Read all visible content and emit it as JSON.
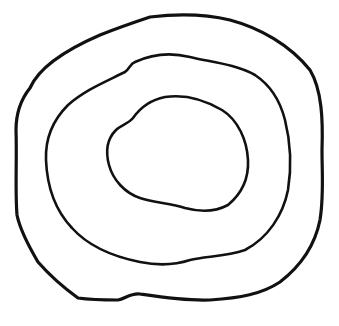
{
  "image": {
    "description": "Hand-drawn sketch of three concentric irregular closed rings",
    "background": "#ffffff",
    "stroke_color": "#111111"
  },
  "rings": [
    {
      "name": "outer-ring",
      "stroke_width": 3.2,
      "path": "M 30 88 C 40 65, 70 48, 100 35 C 120 27, 135 22, 150 17 C 175 14, 205 14, 230 20 C 260 28, 290 45, 310 70 C 322 90, 323 120, 322 150 C 322 175, 324 195, 320 220 C 315 245, 302 265, 280 282 C 262 294, 240 298, 210 300 C 185 301, 160 297, 140 294 C 130 293, 125 299, 118 300 C 100 300, 85 299, 78 298 C 60 285, 45 270, 38 262 C 28 245, 20 230, 17 215 C 15 190, 17 160, 16 130 C 16 110, 22 98, 30 88 Z"
    },
    {
      "name": "middle-ring",
      "stroke_width": 2.6,
      "path": "M 135 62 C 150 55, 170 52, 190 57 C 210 62, 235 64, 255 75 C 270 85, 280 100, 285 120 C 290 140, 292 165, 288 190 C 283 215, 268 238, 245 250 C 225 257, 205 256, 190 260 C 175 265, 160 266, 140 262 C 115 257, 90 248, 72 228 C 55 210, 47 185, 46 160 C 45 135, 55 118, 68 105 C 85 90, 105 82, 125 72 C 130 68, 130 64, 135 62 Z"
    },
    {
      "name": "inner-ring",
      "stroke_width": 2.6,
      "path": "M 133 118 C 140 108, 150 100, 165 97 C 185 94, 205 100, 222 110 C 238 120, 247 140, 248 160 C 249 180, 240 195, 228 205 C 215 212, 200 212, 185 208 C 170 203, 155 203, 140 198 C 125 193, 113 180, 109 165 C 105 150, 108 138, 116 130 C 121 125, 128 124, 133 118 Z"
    }
  ]
}
